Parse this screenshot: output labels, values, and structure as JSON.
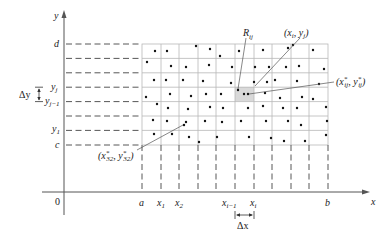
{
  "diagram": {
    "axes": {
      "x_label": "x",
      "y_label": "y",
      "origin_label": "0"
    },
    "x_ticks": [
      {
        "label": "a",
        "sub": ""
      },
      {
        "label": "x",
        "sub": "1"
      },
      {
        "label": "x",
        "sub": "2"
      },
      {
        "label": "x",
        "sub": "i−1"
      },
      {
        "label": "x",
        "sub": "i"
      },
      {
        "label": "b",
        "sub": ""
      }
    ],
    "y_ticks": [
      {
        "label": "d",
        "sub": ""
      },
      {
        "label": "y",
        "sub": "j"
      },
      {
        "label": "y",
        "sub": "j−1"
      },
      {
        "label": "y",
        "sub": "1"
      },
      {
        "label": "c",
        "sub": ""
      }
    ],
    "delta_x_label": "Δx",
    "delta_y_label": "Δy",
    "annotations": {
      "rij": {
        "main": "R",
        "sub": "ij"
      },
      "corner": "(x_i, y_j)",
      "sample_ij": "(x*_ij, y*_ij)",
      "sample_32": "(x*_32, y*_32)"
    },
    "grid": {
      "columns": 10,
      "rows": 7
    },
    "colors": {
      "axis": "#555555",
      "grid": "#b8b8b8",
      "dashes": "#444444",
      "shade": "#d9d9d9",
      "dot": "#111111"
    }
  }
}
